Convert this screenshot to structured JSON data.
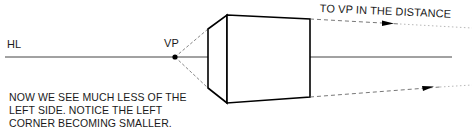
{
  "diagram": {
    "type": "one-point perspective drawing",
    "labels": {
      "horizon_line": "HL",
      "vanishing_point": "VP",
      "distance_note": "TO VP IN THE DISTANCE"
    },
    "caption": {
      "lines": [
        "NOW WE SEE MUCH LESS OF THE",
        "LEFT SIDE. NOTICE THE LEFT",
        "CORNER BECOMING SMALLER."
      ]
    },
    "colors": {
      "stroke": "#111111",
      "dashed": "#555555",
      "background": "#ffffff"
    }
  }
}
